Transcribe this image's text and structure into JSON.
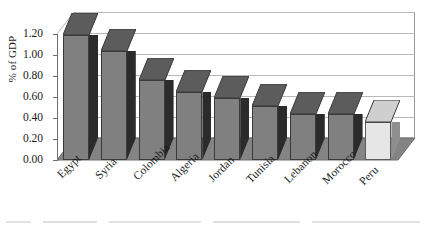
{
  "chart_data": {
    "type": "bar",
    "title": "",
    "subtitle": "",
    "xlabel": "",
    "ylabel": "% of GDP",
    "ylim": [
      0.0,
      1.2
    ],
    "ytick_labels": [
      "1.20",
      "1.00",
      "0.80",
      "0.60",
      "0.40",
      "0.20",
      "0.00"
    ],
    "ytick_values": [
      1.2,
      1.0,
      0.8,
      0.6,
      0.4,
      0.2,
      0.0
    ],
    "grid": true,
    "legend": "none",
    "style_3d": true,
    "categories": [
      "Egypt",
      "Syria",
      "Colombia",
      "Algeria",
      "Jordan",
      "Tunisia",
      "Lebanon",
      "Morocco",
      "Peru"
    ],
    "values": [
      1.19,
      1.04,
      0.76,
      0.65,
      0.59,
      0.51,
      0.44,
      0.44,
      0.36
    ],
    "highlight_category": "Peru",
    "bars": [
      {
        "label": "Egypt",
        "value": 1.19,
        "shade": "dark"
      },
      {
        "label": "Syria",
        "value": 1.04,
        "shade": "dark"
      },
      {
        "label": "Colombia",
        "value": 0.76,
        "shade": "dark"
      },
      {
        "label": "Algeria",
        "value": 0.65,
        "shade": "dark"
      },
      {
        "label": "Jordan",
        "value": 0.59,
        "shade": "dark"
      },
      {
        "label": "Tunisia",
        "value": 0.51,
        "shade": "dark"
      },
      {
        "label": "Lebanon",
        "value": 0.44,
        "shade": "dark"
      },
      {
        "label": "Morocco",
        "value": 0.44,
        "shade": "dark"
      },
      {
        "label": "Peru",
        "value": 0.36,
        "shade": "light"
      }
    ]
  },
  "colors": {
    "bar_front_dark": "#808080",
    "bar_side_dark": "#2b2b2b",
    "bar_top_dark": "#5c5c5c",
    "bar_front_light": "#e6e6e6",
    "bar_side_light": "#8f8f8f",
    "bar_top_light": "#cfcfcf",
    "gridline": "#b9b9b9",
    "axis": "#6e6e6e",
    "floor": "#848484",
    "plot_background": "#ffffff",
    "text": "#1a1a1a"
  }
}
